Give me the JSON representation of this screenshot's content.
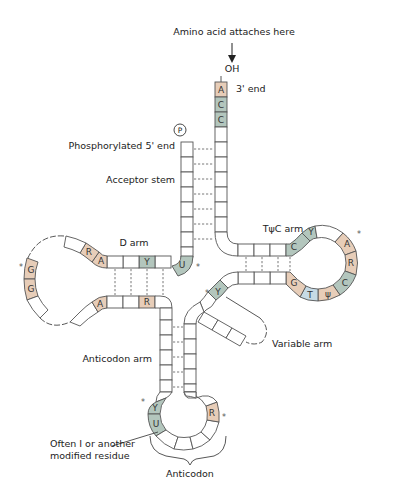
{
  "labels": {
    "amino_acid": "Amino acid attaches here",
    "oh": "OH",
    "three_prime": "3' end",
    "phosphate": "P",
    "five_prime": "Phosphorylated 5' end",
    "acceptor_stem": "Acceptor stem",
    "d_arm": "D arm",
    "tpsic_arm": "TψC arm",
    "variable_arm": "Variable arm",
    "anticodon_arm": "Anticodon arm",
    "wobble_note_1": "Often I or another",
    "wobble_note_2": "modified residue",
    "anticodon": "Anticodon"
  },
  "colors": {
    "purine": "#e7cdb8",
    "pyrimidine": "#b3c6bd",
    "thymine": "#c6dbe6",
    "outline": "#555555"
  },
  "bases": {
    "acceptor_3prime": [
      "A",
      "C",
      "C"
    ],
    "d_arm_top": [
      "R",
      "A",
      "Y"
    ],
    "d_arm_junction": "U",
    "d_loop": [
      "G",
      "G"
    ],
    "d_arm_bottom": [
      "A",
      "R"
    ],
    "tpsic_top": [
      "C",
      "Y"
    ],
    "tpsic_loop": [
      "A",
      "R",
      "C"
    ],
    "tpsic_bottom": [
      "G",
      "T",
      "ψ"
    ],
    "variable_start": "Y",
    "anticodon_loop": [
      "Y",
      "U",
      "R"
    ]
  },
  "legend": {
    "purine": "R / A / G",
    "pyrimidine": "Y / C / U"
  }
}
